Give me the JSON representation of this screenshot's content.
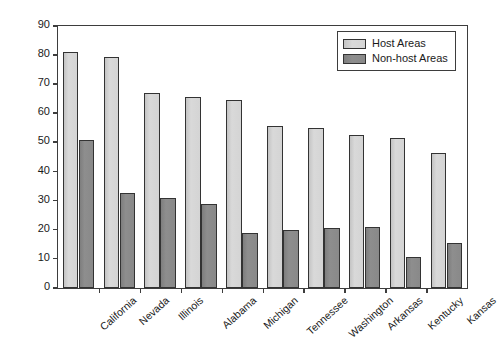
{
  "chart_data": {
    "type": "bar",
    "title": "",
    "xlabel": "",
    "ylabel": "Percent People of Color",
    "ylim": [
      0,
      90
    ],
    "yticks": [
      0,
      10,
      20,
      30,
      40,
      50,
      60,
      70,
      80,
      90
    ],
    "grid": false,
    "legend_position": "top-right",
    "categories": [
      "California",
      "Nevada",
      "Illinois",
      "Alabama",
      "Michigan",
      "Tennessee",
      "Washington",
      "Arkansas",
      "Kentucky",
      "Kansas"
    ],
    "series": [
      {
        "name": "Host Areas",
        "color": "#d4d4d4",
        "values": [
          81,
          79.5,
          67,
          65.5,
          64.5,
          55.5,
          55,
          52.5,
          51.5,
          46.5
        ]
      },
      {
        "name": "Non-host Areas",
        "color": "#8a8a8a",
        "values": [
          51,
          32.5,
          31,
          29,
          19,
          20,
          20.5,
          21,
          10.5,
          15.5
        ]
      }
    ]
  },
  "legend": {
    "items": [
      {
        "label": "Host Areas"
      },
      {
        "label": "Non-host Areas"
      }
    ]
  }
}
